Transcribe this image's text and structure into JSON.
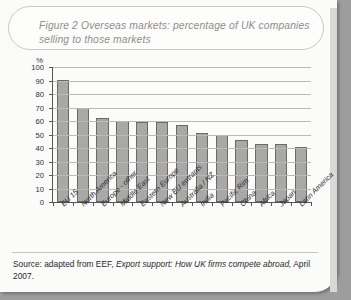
{
  "figure": {
    "title_label": "Figure 2",
    "title_text": "Overseas markets: percentage of UK companies selling to those markets",
    "source_text": "Source: adapted from EEF, Export support: How UK firms compete abroad, April 2007.",
    "source_prefix": "Source: adapted from EEF, ",
    "source_italic": "Export support: How UK firms compete abroad,",
    "source_suffix": " April 2007."
  },
  "chart_data": {
    "type": "bar",
    "title": "Figure 2 Overseas markets: percentage of UK companies selling to those markets",
    "xlabel": "",
    "ylabel": "%",
    "ylim": [
      0,
      100
    ],
    "yticks": [
      0,
      10,
      20,
      30,
      40,
      50,
      60,
      70,
      80,
      90,
      100
    ],
    "grid": true,
    "legend": "none",
    "categories": [
      "EU 15",
      "North America",
      "Europe - other",
      "Middle East",
      "Eastern Europe",
      "New EU entrants",
      "Australia / NZ",
      "India",
      "Pacific Rim",
      "China",
      "Africa",
      "Japan",
      "Latin America"
    ],
    "values": [
      90.5,
      69.5,
      62,
      60,
      59,
      59,
      57,
      51,
      50,
      46,
      43,
      43,
      41
    ],
    "bar_color": "#a8a8a6",
    "bar_edge_color": "#6a6a68"
  }
}
